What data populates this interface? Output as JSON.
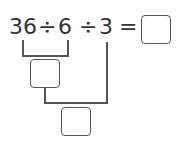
{
  "expression": {
    "tokens": [
      "36",
      "÷",
      "6",
      "÷",
      "3",
      "="
    ],
    "answer_box": ""
  },
  "steps": {
    "step1_box": "",
    "step2_box": ""
  },
  "colors": {
    "text": "#333333",
    "lines": "#555555"
  }
}
